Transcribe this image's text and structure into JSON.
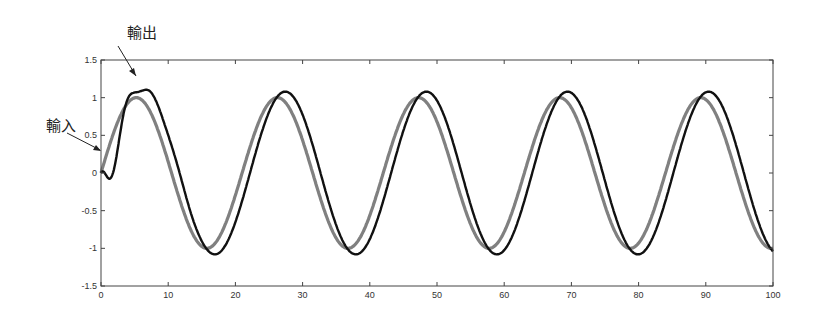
{
  "chart_data": {
    "type": "line",
    "title": "",
    "xlabel": "",
    "ylabel": "",
    "xlim": [
      0,
      100
    ],
    "ylim": [
      -1.5,
      1.5
    ],
    "grid": false,
    "legend": "none",
    "x_ticks": [
      "0",
      "10",
      "20",
      "30",
      "40",
      "50",
      "60",
      "70",
      "80",
      "90",
      "100"
    ],
    "y_ticks": [
      "1.5",
      "1",
      "0.5",
      "0",
      "-0.5",
      "-1",
      "-1.5"
    ],
    "series": [
      {
        "name": "輸入",
        "color": "#808080",
        "description": "Input sine wave, amplitude 1, period ~21",
        "amplitude": 1.0,
        "period": 21
      },
      {
        "name": "輸出",
        "color": "#111111",
        "description": "Output response: starts at 0, first peak ~1.17 near x=5.5, steady amplitude ~1.08, slight lag",
        "first_peak": 1.17,
        "steady_amplitude": 1.08,
        "period": 21
      }
    ],
    "annotations": [
      {
        "text": "輸出",
        "points_to": "output first peak (x≈5.5, y≈1.17)"
      },
      {
        "text": "輸入",
        "points_to": "input curve near x≈0, y≈0.25"
      }
    ]
  },
  "labels": {
    "output": "輸出",
    "input": "輸入"
  }
}
